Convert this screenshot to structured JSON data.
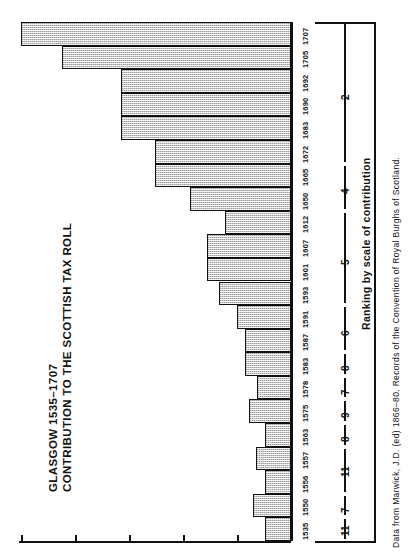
{
  "title": {
    "line1": "GLASGOW 1535–1707",
    "line2": "CONTRIBUTION TO THE SCOTTISH TAX ROLL"
  },
  "source_note": "Data from Marwick, J.D. (ed) 1866–80. Records of the Convention of Royal Burghs of Scotland.",
  "rank_axis_title": "Ranking by scale of contribution",
  "colors": {
    "bar_fill": "#c9c9c9",
    "bar_stroke": "#111111",
    "axis": "#111111",
    "text": "#111111",
    "background": "#ffffff"
  },
  "chart_data": {
    "type": "bar",
    "orientation": "horizontal",
    "title": "GLASGOW 1535–1707 CONTRIBUTION TO THE SCOTTISH TAX ROLL",
    "xlabel": "",
    "ylabel": "",
    "grid": false,
    "legend": "none",
    "categories": [
      "1707",
      "1705",
      "1692",
      "1690",
      "1683",
      "1672",
      "1665",
      "1650",
      "1612",
      "1607",
      "1601",
      "1593",
      "1591",
      "1587",
      "1583",
      "1578",
      "1575",
      "1563",
      "1557",
      "1556",
      "1550",
      "1535"
    ],
    "values": [
      100.0,
      84.7,
      63.0,
      63.0,
      63.0,
      50.4,
      50.4,
      37.5,
      24.6,
      31.0,
      31.0,
      26.6,
      20.0,
      17.0,
      17.0,
      12.5,
      15.6,
      9.5,
      12.8,
      9.5,
      14.2,
      9.5
    ],
    "value_axis_ticks": [
      0,
      20,
      40,
      60,
      80,
      100
    ],
    "value_axis_tick_labels": [
      "",
      "",
      "",
      "",
      "",
      ""
    ],
    "xlim": [
      0,
      100
    ]
  },
  "rankings": [
    {
      "rank": "2",
      "years": [
        "1707",
        "1705",
        "1692",
        "1690",
        "1683",
        "1672"
      ]
    },
    {
      "rank": "4",
      "years": [
        "1665",
        "1650"
      ]
    },
    {
      "rank": "5",
      "years": [
        "1612",
        "1607",
        "1601",
        "1593"
      ]
    },
    {
      "rank": "6",
      "years": [
        "1591",
        "1587"
      ]
    },
    {
      "rank": "8",
      "years": [
        "1583"
      ]
    },
    {
      "rank": "7",
      "years": [
        "1578"
      ]
    },
    {
      "rank": "9",
      "years": [
        "1575"
      ]
    },
    {
      "rank": "8",
      "years": [
        "1563"
      ]
    },
    {
      "rank": "11",
      "years": [
        "1557",
        "1556"
      ]
    },
    {
      "rank": "7",
      "years": [
        "1550"
      ]
    },
    {
      "rank": "11",
      "years": [
        "1535"
      ]
    }
  ]
}
